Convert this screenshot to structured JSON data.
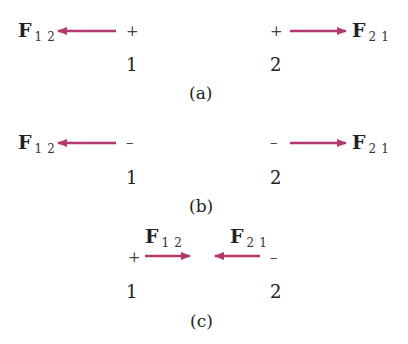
{
  "figure": {
    "arrow_color": "#b5376d",
    "panels": [
      {
        "caption": "(a)",
        "charge1": {
          "label": "1",
          "sign": "+"
        },
        "charge2": {
          "label": "2",
          "sign": "+"
        },
        "force12": {
          "symbol": "F",
          "subscript": "12",
          "direction": "left"
        },
        "force21": {
          "symbol": "F",
          "subscript": "21",
          "direction": "right"
        }
      },
      {
        "caption": "(b)",
        "charge1": {
          "label": "1",
          "sign": "–"
        },
        "charge2": {
          "label": "2",
          "sign": "–"
        },
        "force12": {
          "symbol": "F",
          "subscript": "12",
          "direction": "left"
        },
        "force21": {
          "symbol": "F",
          "subscript": "21",
          "direction": "right"
        }
      },
      {
        "caption": "(c)",
        "charge1": {
          "label": "1",
          "sign": "+"
        },
        "charge2": {
          "label": "2",
          "sign": "–"
        },
        "force12": {
          "symbol": "F",
          "subscript": "12",
          "direction": "right"
        },
        "force21": {
          "symbol": "F",
          "subscript": "21",
          "direction": "left"
        }
      }
    ]
  }
}
